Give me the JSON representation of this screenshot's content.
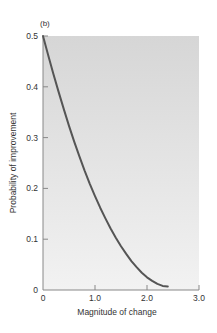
{
  "chart_data": {
    "type": "line",
    "panel_label": "(b)",
    "title": "",
    "xlabel": "Magnitude of change",
    "ylabel": "Probability of improvement",
    "xlim": [
      0,
      3.0
    ],
    "ylim": [
      0,
      0.5
    ],
    "x_ticks": [
      0,
      1.0,
      2.0,
      3.0
    ],
    "x_tick_labels": [
      "0",
      "1.0",
      "2.0",
      "3.0"
    ],
    "y_ticks": [
      0,
      0.1,
      0.2,
      0.3,
      0.4,
      0.5
    ],
    "y_tick_labels": [
      "0",
      "0.1",
      "0.2",
      "0.3",
      "0.4",
      "0.5"
    ],
    "grid": false,
    "legend": "none",
    "series": [
      {
        "name": "Probability of improvement",
        "color": "#555555",
        "x": [
          0,
          0.1,
          0.2,
          0.3,
          0.4,
          0.5,
          0.6,
          0.7,
          0.8,
          0.9,
          1.0,
          1.1,
          1.2,
          1.3,
          1.4,
          1.5,
          1.6,
          1.7,
          1.8,
          1.9,
          2.0,
          2.1,
          2.2,
          2.3,
          2.4
        ],
        "y": [
          0.5,
          0.462,
          0.425,
          0.39,
          0.356,
          0.323,
          0.292,
          0.263,
          0.235,
          0.209,
          0.185,
          0.162,
          0.141,
          0.121,
          0.103,
          0.086,
          0.071,
          0.057,
          0.045,
          0.034,
          0.025,
          0.018,
          0.012,
          0.008,
          0.007
        ]
      }
    ],
    "colors": {
      "background_top": "#d6d6d6",
      "background_bottom": "#f2f2f2",
      "axis": "#888888",
      "text": "#333333"
    }
  }
}
